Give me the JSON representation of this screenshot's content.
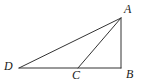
{
  "figure": {
    "kind": "geometry-diagram",
    "stroke_color": "#333333",
    "label_color": "#1a1a1a",
    "background_color": "#ffffff",
    "canvas": {
      "width": 145,
      "height": 84
    }
  },
  "points": [
    {
      "id": "A",
      "label": "A",
      "x": 121,
      "y": 18
    },
    {
      "id": "B",
      "label": "B",
      "x": 121,
      "y": 68
    },
    {
      "id": "C",
      "label": "C",
      "x": 78,
      "y": 68
    },
    {
      "id": "D",
      "label": "D",
      "x": 19,
      "y": 68
    }
  ],
  "segments": [
    {
      "id": "DA",
      "from": "D",
      "to": "A",
      "x1": 19,
      "y1": 68,
      "x2": 121,
      "y2": 18
    },
    {
      "id": "DB",
      "from": "D",
      "to": "B",
      "x1": 19,
      "y1": 68,
      "x2": 121,
      "y2": 68
    },
    {
      "id": "CA",
      "from": "C",
      "to": "A",
      "x1": 78,
      "y1": 68,
      "x2": 121,
      "y2": 18
    },
    {
      "id": "AB",
      "from": "A",
      "to": "B",
      "x1": 121,
      "y1": 18,
      "x2": 121,
      "y2": 68
    }
  ]
}
